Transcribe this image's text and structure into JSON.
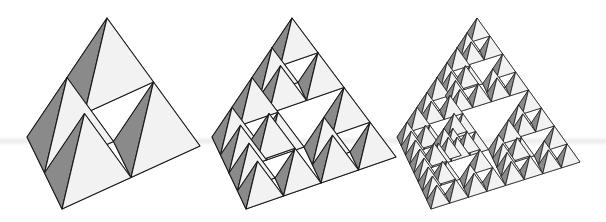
{
  "figure": {
    "colors": {
      "dark_face": "#8a8a8a",
      "light_face": "#f2f2f2",
      "hole_inner": "#ffffff",
      "edge": "#1a1a1a",
      "background": "#ffffff"
    },
    "tetrahedra": [
      {
        "name": "level-1",
        "depth": 1,
        "apex": [
          107,
          18
        ],
        "left": [
          27,
          137
        ],
        "bottom": [
          62,
          209
        ],
        "right": [
          200,
          146
        ]
      },
      {
        "name": "level-2",
        "depth": 2,
        "apex": [
          292,
          18
        ],
        "left": [
          212,
          137
        ],
        "bottom": [
          246,
          209
        ],
        "right": [
          396,
          157
        ]
      },
      {
        "name": "level-3",
        "depth": 3,
        "apex": [
          477,
          18
        ],
        "left": [
          397,
          137
        ],
        "bottom": [
          431,
          209
        ],
        "right": [
          580,
          162
        ]
      }
    ]
  }
}
